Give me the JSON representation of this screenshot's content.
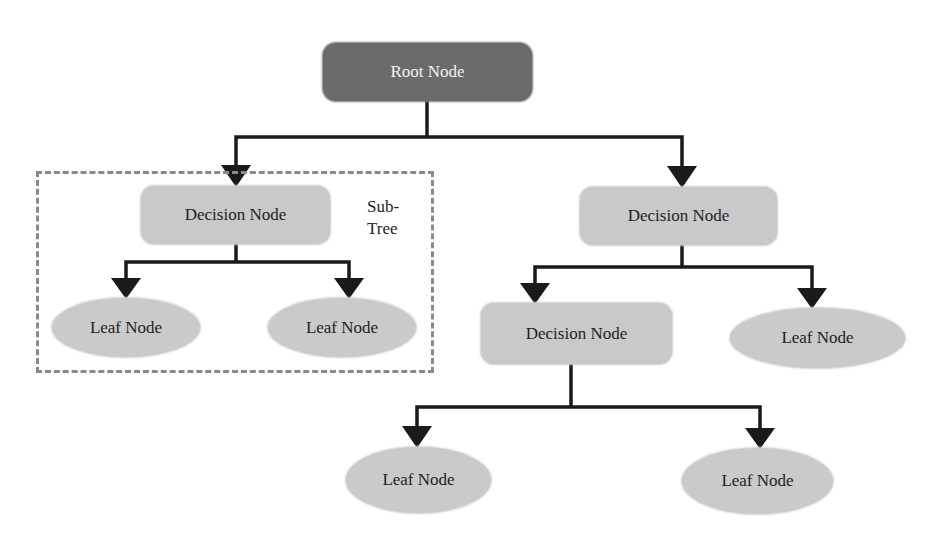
{
  "diagram": {
    "type": "decision-tree",
    "colors": {
      "root_fill": "#6b6b6b",
      "root_text": "#f4f4f4",
      "node_fill": "#c9c9c9",
      "text": "#1e1e1e",
      "connector": "#1a1a1a",
      "subtree_border": "#8a8a8a",
      "background": "#ffffff"
    },
    "nodes": {
      "root": {
        "label": "Root Node",
        "shape": "rounded-rect"
      },
      "decision_left": {
        "label": "Decision Node",
        "shape": "rounded-rect"
      },
      "leaf_left_1": {
        "label": "Leaf Node",
        "shape": "ellipse"
      },
      "leaf_left_2": {
        "label": "Leaf Node",
        "shape": "ellipse"
      },
      "decision_right": {
        "label": "Decision Node",
        "shape": "rounded-rect"
      },
      "decision_right_child": {
        "label": "Decision Node",
        "shape": "rounded-rect"
      },
      "leaf_right": {
        "label": "Leaf Node",
        "shape": "ellipse"
      },
      "leaf_bottom_1": {
        "label": "Leaf Node",
        "shape": "ellipse"
      },
      "leaf_bottom_2": {
        "label": "Leaf Node",
        "shape": "ellipse"
      }
    },
    "subtree": {
      "label_line1": "Sub-",
      "label_line2": "Tree"
    },
    "edges": [
      [
        "root",
        "decision_left"
      ],
      [
        "root",
        "decision_right"
      ],
      [
        "decision_left",
        "leaf_left_1"
      ],
      [
        "decision_left",
        "leaf_left_2"
      ],
      [
        "decision_right",
        "decision_right_child"
      ],
      [
        "decision_right",
        "leaf_right"
      ],
      [
        "decision_right_child",
        "leaf_bottom_1"
      ],
      [
        "decision_right_child",
        "leaf_bottom_2"
      ]
    ]
  }
}
